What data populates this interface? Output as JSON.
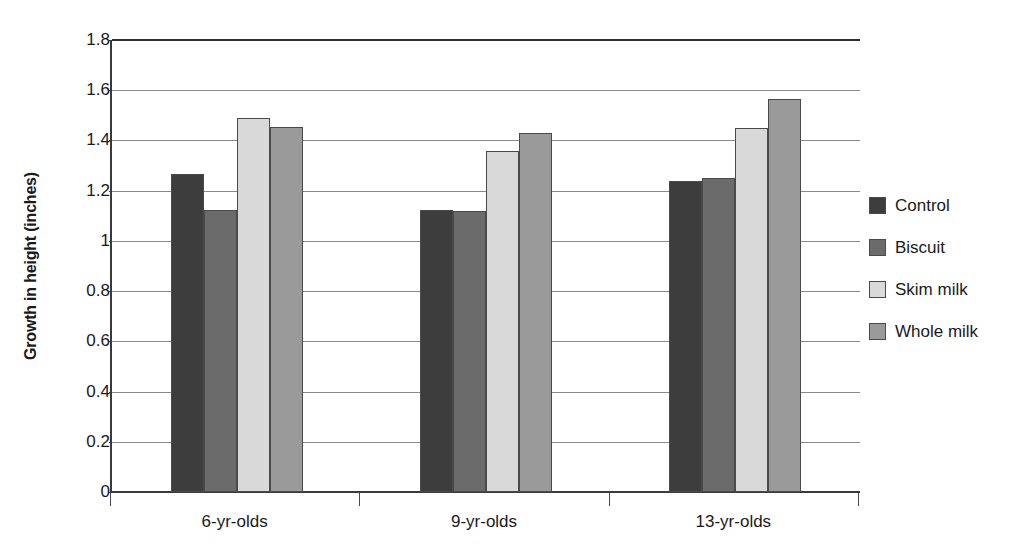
{
  "chart_data": {
    "type": "bar",
    "title": "",
    "subtitle": "",
    "xlabel": "",
    "ylabel": "Growth in height (inches)",
    "categories": [
      "6-yr-olds",
      "9-yr-olds",
      "13-yr-olds"
    ],
    "series": [
      {
        "name": "Control",
        "color": "#3d3d3d",
        "values": [
          1.265,
          1.125,
          1.24
        ]
      },
      {
        "name": "Biscuit",
        "color": "#6b6b6b",
        "values": [
          1.125,
          1.12,
          1.25
        ]
      },
      {
        "name": "Skim milk",
        "color": "#d9d9d9",
        "values": [
          1.49,
          1.36,
          1.45
        ]
      },
      {
        "name": "Whole milk",
        "color": "#9a9a9a",
        "values": [
          1.455,
          1.43,
          1.565
        ]
      }
    ],
    "ylim": [
      0,
      1.8
    ],
    "ytick_values": [
      0,
      0.2,
      0.4,
      0.6,
      0.8,
      1.0,
      1.2,
      1.4,
      1.6,
      1.8
    ],
    "ytick_labels": [
      "0",
      "0.2",
      "0.4",
      "0.6",
      "0.8",
      "1",
      "1.2",
      "1.4",
      "1.6",
      "1.8"
    ],
    "grid": true,
    "legend_position": "right",
    "legend_entries": [
      "Control",
      "Biscuit",
      "Skim milk",
      "Whole milk"
    ]
  }
}
